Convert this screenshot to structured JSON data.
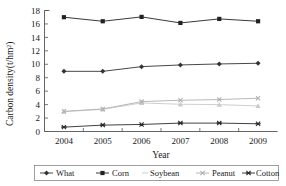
{
  "chart_data": {
    "type": "line",
    "title": "",
    "xlabel": "Year",
    "ylabel": "Carbon density(t/hm2)",
    "ylabel_display": "Carbon density(t/hm²)",
    "categories": [
      "2004",
      "2005",
      "2006",
      "2007",
      "2008",
      "2009"
    ],
    "x": [
      2004,
      2005,
      2006,
      2007,
      2008,
      2009
    ],
    "ylim": [
      0,
      18
    ],
    "yticks": [
      0,
      2,
      4,
      6,
      8,
      10,
      12,
      14,
      16,
      18
    ],
    "grid": false,
    "legend_position": "bottom",
    "series": [
      {
        "name": "What",
        "marker": "diamond",
        "color": "#333333",
        "values": [
          8.95,
          8.95,
          9.65,
          9.9,
          10.05,
          10.15
        ]
      },
      {
        "name": "Corn",
        "marker": "square",
        "color": "#222222",
        "values": [
          17.0,
          16.4,
          17.05,
          16.15,
          16.75,
          16.4
        ]
      },
      {
        "name": "Soybean",
        "marker": "triangle",
        "color": "#c9c9c9",
        "values": [
          2.95,
          3.3,
          4.25,
          4.05,
          4.0,
          3.8
        ]
      },
      {
        "name": "Peanut",
        "marker": "cross",
        "color": "#b0b0b0",
        "values": [
          3.0,
          3.35,
          4.45,
          4.65,
          4.75,
          4.95
        ]
      },
      {
        "name": "Cotton",
        "marker": "star",
        "color": "#2b2b2b",
        "values": [
          0.65,
          0.95,
          1.05,
          1.25,
          1.25,
          1.15
        ]
      }
    ]
  },
  "axis": {
    "y_tick_labels": [
      "18",
      "16",
      "14",
      "12",
      "10",
      "8",
      "6",
      "4",
      "2",
      "0"
    ],
    "x_tick_labels": [
      "2004",
      "2005",
      "2006",
      "2007",
      "2008",
      "2009"
    ]
  },
  "legend": {
    "items": [
      {
        "label": "What"
      },
      {
        "label": "Corn"
      },
      {
        "label": "Soybean"
      },
      {
        "label": "Peanut"
      },
      {
        "label": "Cotton"
      }
    ]
  }
}
